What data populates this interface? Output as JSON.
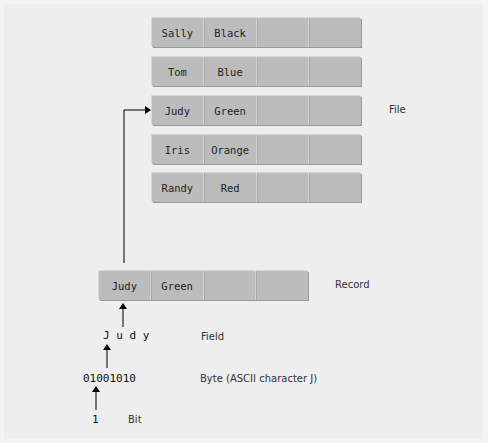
{
  "diagram": {
    "file": {
      "label": "File",
      "records": [
        {
          "name": "Sally",
          "color": "Black"
        },
        {
          "name": "Tom",
          "color": "Blue"
        },
        {
          "name": "Judy",
          "color": "Green"
        },
        {
          "name": "Iris",
          "color": "Orange"
        },
        {
          "name": "Randy",
          "color": "Red"
        }
      ]
    },
    "record": {
      "label": "Record",
      "fields": [
        "Judy",
        "Green",
        "",
        ""
      ]
    },
    "field": {
      "label": "Field",
      "value": "J u d y"
    },
    "byte": {
      "label": "Byte (ASCII character J)",
      "value": "01001010"
    },
    "bit": {
      "label": "Bit",
      "value": "1"
    },
    "colors": {
      "background": "#eeeeee",
      "cell": "#bcbcbc",
      "arrow": "#000000"
    }
  }
}
